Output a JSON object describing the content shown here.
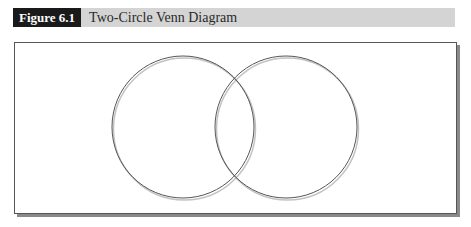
{
  "figure": {
    "label": "Figure 6.1",
    "title": "Two-Circle Venn Diagram"
  },
  "diagram": {
    "type": "venn",
    "sets": 2,
    "circles": [
      {
        "name": "left-circle",
        "cx": 183,
        "cy": 127,
        "r": 71,
        "label": ""
      },
      {
        "name": "right-circle",
        "cx": 286,
        "cy": 127,
        "r": 71,
        "label": ""
      }
    ],
    "stroke_color": "#555555",
    "shadow_color": "#9a9a9a"
  },
  "colors": {
    "label_bg": "#1a1a1a",
    "header_bg": "#d4d4d4",
    "frame_border": "#555555"
  }
}
